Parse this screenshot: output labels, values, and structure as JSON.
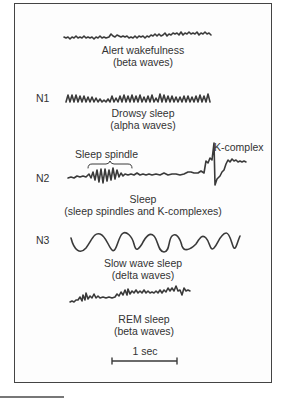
{
  "figure": {
    "stages": [
      {
        "id": "wake",
        "stage_label": "",
        "title": "Alert wakefulness",
        "subtitle": "(beta waves)"
      },
      {
        "id": "n1",
        "stage_label": "N1",
        "title": "Drowsy sleep",
        "subtitle": "(alpha waves)"
      },
      {
        "id": "n2",
        "stage_label": "N2",
        "title": "Sleep",
        "subtitle": "(sleep spindles and K-complexes)"
      },
      {
        "id": "n3",
        "stage_label": "N3",
        "title": "Slow wave sleep",
        "subtitle": "(delta waves)"
      },
      {
        "id": "rem",
        "stage_label": "",
        "title": "REM sleep",
        "subtitle": "(beta waves)"
      }
    ],
    "annotations": {
      "sleep_spindle": "Sleep spindle",
      "k_complex": "K-complex"
    },
    "scale_bar": {
      "label": "1 sec"
    },
    "colors": {
      "trace": "#3a3a3a",
      "frame": "#444444",
      "text": "#333333"
    }
  }
}
